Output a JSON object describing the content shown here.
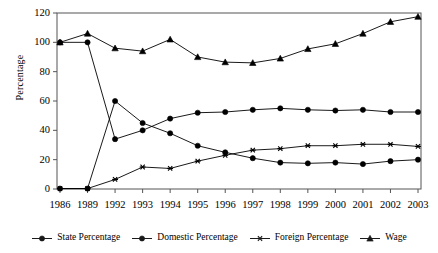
{
  "chart_data": {
    "type": "line",
    "title": "",
    "xlabel": "",
    "ylabel": "Percentage",
    "categories": [
      "1986",
      "1989",
      "1992",
      "1993",
      "1994",
      "1995",
      "1996",
      "1997",
      "1998",
      "1999",
      "2000",
      "2001",
      "2002",
      "2003"
    ],
    "ylim": [
      0,
      120
    ],
    "yticks": [
      0,
      20,
      40,
      60,
      80,
      100,
      120
    ],
    "grid": false,
    "legend_position": "bottom",
    "series": [
      {
        "name": "State Percentage",
        "marker": "circle",
        "color": "#000000",
        "values": [
          0.3,
          0.3,
          60,
          45,
          38,
          29.5,
          25,
          21,
          18,
          17.5,
          18,
          17,
          19,
          20
        ]
      },
      {
        "name": "Domestic Percentage",
        "marker": "circle",
        "color": "#000000",
        "values": [
          100,
          100,
          34,
          40,
          48,
          52,
          52.5,
          54,
          55,
          54,
          53.5,
          54,
          52.5,
          52.5
        ]
      },
      {
        "name": "Foreign Percentage",
        "marker": "asterisk",
        "color": "#000000",
        "values": [
          0.3,
          0.3,
          6.5,
          15,
          14,
          19,
          23,
          26.5,
          27.5,
          29.5,
          29.5,
          30.5,
          30.5,
          29
        ]
      },
      {
        "name": "Wage",
        "marker": "triangle",
        "color": "#000000",
        "values": [
          100,
          106,
          96,
          94,
          102,
          90,
          86.5,
          86,
          89,
          95.5,
          99,
          106,
          114,
          117.5
        ]
      }
    ]
  },
  "axes": {
    "y_title": "Percentage",
    "y_tick_labels": [
      "0",
      "20",
      "40",
      "60",
      "80",
      "100",
      "120"
    ],
    "x_tick_labels": [
      "1986",
      "1989",
      "1992",
      "1993",
      "1994",
      "1995",
      "1996",
      "1997",
      "1998",
      "1999",
      "2000",
      "2001",
      "2002",
      "2003"
    ]
  },
  "legend": {
    "entries": [
      {
        "label": "State Percentage",
        "marker": "circle-marker"
      },
      {
        "label": "Domestic Percentage",
        "marker": "circle-marker"
      },
      {
        "label": "Foreign Percentage",
        "marker": "asterisk-marker"
      },
      {
        "label": "Wage",
        "marker": "triangle-marker"
      }
    ]
  },
  "style": {
    "line_color": "#1a1a1a",
    "frame_color": "#555555",
    "background": "#ffffff"
  }
}
